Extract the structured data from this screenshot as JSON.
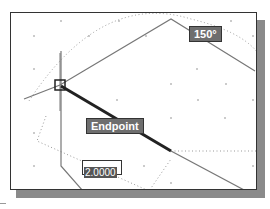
{
  "tooltips": {
    "angle": "150°",
    "osnap": "Endpoint"
  },
  "dynamic_input": {
    "value": "2.0000"
  },
  "colors": {
    "tooltip_bg": "#6e6e6e",
    "tooltip_text": "#ffffff",
    "line": "#777777",
    "active_line": "#222222",
    "shadow": "#8a8a8a"
  }
}
